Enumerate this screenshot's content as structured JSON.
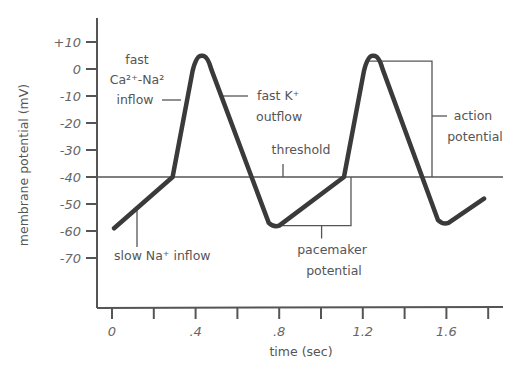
{
  "chart_data": {
    "type": "line",
    "title": "",
    "xlabel": "time (sec)",
    "ylabel": "membrane potential (mV)",
    "xlim": [
      0,
      1.8
    ],
    "ylim": [
      -80,
      15
    ],
    "x_ticks": [
      0,
      0.2,
      0.4,
      0.6,
      0.8,
      1.0,
      1.2,
      1.4,
      1.6,
      1.8
    ],
    "x_tick_labels": [
      {
        "value": 0,
        "label": "0"
      },
      {
        "value": 0.4,
        "label": ".4"
      },
      {
        "value": 0.8,
        "label": ".8"
      },
      {
        "value": 1.2,
        "label": "1.2"
      },
      {
        "value": 1.6,
        "label": "1.6"
      }
    ],
    "y_ticks": [
      {
        "value": 10,
        "label": "+10"
      },
      {
        "value": 0,
        "label": "0"
      },
      {
        "value": -10,
        "label": "-10"
      },
      {
        "value": -20,
        "label": "-20"
      },
      {
        "value": -30,
        "label": "-30"
      },
      {
        "value": -40,
        "label": "-40"
      },
      {
        "value": -50,
        "label": "-50"
      },
      {
        "value": -60,
        "label": "-60"
      },
      {
        "value": -70,
        "label": "-70"
      }
    ],
    "grid": false,
    "series": [
      {
        "name": "pacemaker cell membrane potential",
        "points": [
          {
            "t": 0.01,
            "v": -59
          },
          {
            "t": 0.29,
            "v": -40
          },
          {
            "t": 0.4,
            "v": 3
          },
          {
            "t": 0.46,
            "v": 3
          },
          {
            "t": 0.75,
            "v": -57
          },
          {
            "t": 0.8,
            "v": -58
          },
          {
            "t": 1.11,
            "v": -40
          },
          {
            "t": 1.22,
            "v": 3
          },
          {
            "t": 1.28,
            "v": 3
          },
          {
            "t": 1.56,
            "v": -56
          },
          {
            "t": 1.61,
            "v": -57
          },
          {
            "t": 1.78,
            "v": -48
          }
        ]
      }
    ],
    "threshold": {
      "value": -40,
      "label": "threshold"
    },
    "annotations": [
      {
        "id": "fast-ca-na-inflow",
        "lines": [
          "fast",
          "Ca²⁺-Na²",
          "inflow"
        ]
      },
      {
        "id": "fast-k-outflow",
        "lines": [
          "fast K⁺",
          "outflow"
        ]
      },
      {
        "id": "slow-na-inflow",
        "lines": [
          "slow Na⁺ inflow"
        ]
      },
      {
        "id": "pacemaker-potential",
        "lines": [
          "pacemaker",
          "potential"
        ],
        "range": {
          "t": [
            0.8,
            1.11
          ],
          "v": [
            -58,
            -40
          ]
        }
      },
      {
        "id": "action-potential",
        "lines": [
          "action",
          "potential"
        ],
        "range": {
          "v": [
            -40,
            4
          ]
        }
      }
    ]
  }
}
